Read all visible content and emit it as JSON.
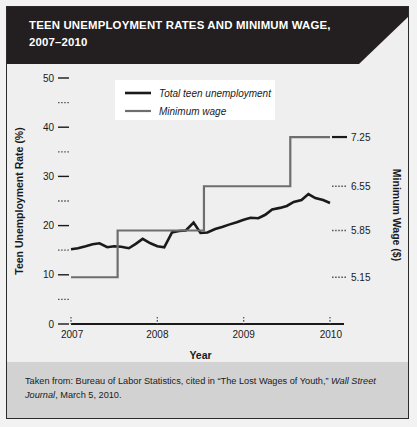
{
  "banner": {
    "line1": "TEEN UNEMPLOYMENT RATES AND MINIMUM WAGE,",
    "line2": "2007–2010"
  },
  "footer": {
    "part1": "Taken from: Bureau of Labor Statistics, cited in “The Lost Wages of Youth,” ",
    "italic1": "Wall Street Journal",
    "part2": ", March 5, 2010."
  },
  "colors": {
    "banner_bg": "#231f20",
    "card_bg": "#efefef",
    "footer_bg": "#d2d2d2",
    "unemployment_line": "#1a1a1a",
    "wage_line": "#6e6e6e",
    "axis": "#1a1a1a"
  },
  "chart_data": {
    "type": "line",
    "title": "TEEN UNEMPLOYMENT RATES AND MINIMUM WAGE, 2007–2010",
    "xlabel": "Year",
    "ylabel": "Teen Unemployment Rate (%)",
    "y2label": "Minimum Wage ($)",
    "grid": false,
    "legend_position": "top-center",
    "xlim": [
      2007,
      2010
    ],
    "ylim": [
      0,
      50
    ],
    "y2lim_mapped_from_left": {
      "5.15": 9.5,
      "5.85": 19,
      "6.55": 28,
      "7.25": 38
    },
    "xticks": [
      2007,
      2008,
      2009,
      2010
    ],
    "xtick_labels": [
      "2007",
      "2008",
      "2009",
      "2010"
    ],
    "yticks": [
      0,
      10,
      20,
      30,
      40,
      50
    ],
    "ytick_labels": [
      "0",
      "10",
      "20",
      "30",
      "40",
      "50"
    ],
    "yticks_minor": [
      5,
      15,
      25,
      35,
      45
    ],
    "y2ticks": [
      5.15,
      5.85,
      6.55,
      7.25
    ],
    "y2tick_labels": [
      "5.15",
      "5.85",
      "6.55",
      "7.25"
    ],
    "legend": [
      {
        "name": "Total teen unemployment",
        "color": "#1a1a1a",
        "width": 2.6
      },
      {
        "name": "Minimum wage",
        "color": "#6e6e6e",
        "width": 2.2
      }
    ],
    "series": [
      {
        "name": "Total teen unemployment",
        "color": "#1a1a1a",
        "x": [
          2007.0,
          2007.08,
          2007.17,
          2007.25,
          2007.33,
          2007.42,
          2007.5,
          2007.58,
          2007.67,
          2007.75,
          2007.83,
          2007.92,
          2008.0,
          2008.08,
          2008.17,
          2008.25,
          2008.33,
          2008.42,
          2008.5,
          2008.58,
          2008.67,
          2008.75,
          2008.83,
          2008.92,
          2009.0,
          2009.08,
          2009.17,
          2009.25,
          2009.33,
          2009.42,
          2009.5,
          2009.58,
          2009.67,
          2009.75,
          2009.83,
          2009.92,
          2010.0
        ],
        "y": [
          15.2,
          15.4,
          15.8,
          16.2,
          16.4,
          15.6,
          15.8,
          15.7,
          15.4,
          16.3,
          17.3,
          16.4,
          15.8,
          15.6,
          18.6,
          18.9,
          19.0,
          20.6,
          18.5,
          18.6,
          19.3,
          19.7,
          20.2,
          20.7,
          21.2,
          21.6,
          21.5,
          22.2,
          23.3,
          23.6,
          24.0,
          24.8,
          25.2,
          26.4,
          25.6,
          25.2,
          24.6
        ]
      },
      {
        "name": "Minimum wage",
        "color": "#6e6e6e",
        "step": "post",
        "x": [
          2007.0,
          2007.54,
          2007.54,
          2008.54,
          2008.54,
          2009.54,
          2009.54,
          2010.0
        ],
        "y": [
          9.5,
          9.5,
          19.0,
          19.0,
          28.0,
          28.0,
          38.0,
          38.0
        ],
        "dollar_values": [
          5.15,
          5.15,
          5.85,
          5.85,
          6.55,
          6.55,
          7.25,
          7.25
        ]
      }
    ]
  }
}
